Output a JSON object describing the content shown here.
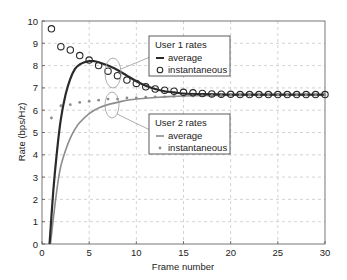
{
  "chart_data": {
    "type": "line",
    "title": "",
    "xlabel": "Frame number",
    "ylabel": "Rate (bps/Hz)",
    "xlim": [
      0,
      30
    ],
    "ylim": [
      0,
      10
    ],
    "xticks": [
      0,
      5,
      10,
      15,
      20,
      25,
      30
    ],
    "yticks": [
      0,
      1,
      2,
      3,
      4,
      5,
      6,
      7,
      8,
      9,
      10
    ],
    "grid": true,
    "series": [
      {
        "name": "User 1 rates - average",
        "style": "line",
        "color": "#2a2a2a",
        "x": [
          0.8,
          1.2,
          1.6,
          2.0,
          2.5,
          3.0,
          3.5,
          4.0,
          4.5,
          5.0,
          5.5,
          6.0,
          7.0,
          8.0,
          9.0,
          10.0,
          11.0,
          12.0,
          13.0,
          14.0,
          15.0,
          17.0,
          20.0,
          25.0,
          30.0
        ],
        "values": [
          0.0,
          2.4,
          4.2,
          5.6,
          6.7,
          7.4,
          7.85,
          8.05,
          8.15,
          8.2,
          8.2,
          8.15,
          8.0,
          7.8,
          7.55,
          7.3,
          7.1,
          6.95,
          6.85,
          6.8,
          6.75,
          6.72,
          6.7,
          6.7,
          6.7
        ]
      },
      {
        "name": "User 1 rates - instantaneous",
        "style": "circle-marker",
        "color": "#2a2a2a",
        "x": [
          1,
          2,
          3,
          4,
          5,
          6,
          7,
          8,
          9,
          10,
          11,
          12,
          13,
          14,
          15,
          16,
          17,
          18,
          19,
          20,
          21,
          22,
          23,
          24,
          25,
          26,
          27,
          28,
          29,
          30
        ],
        "values": [
          9.65,
          8.85,
          8.7,
          8.45,
          8.25,
          8.0,
          7.75,
          7.55,
          7.35,
          7.2,
          7.05,
          6.95,
          6.9,
          6.85,
          6.8,
          6.78,
          6.75,
          6.73,
          6.72,
          6.71,
          6.7,
          6.7,
          6.7,
          6.7,
          6.7,
          6.7,
          6.7,
          6.7,
          6.7,
          6.7
        ]
      },
      {
        "name": "User 2 rates - average",
        "style": "line",
        "color": "#8c8c8c",
        "x": [
          0.9,
          1.3,
          1.7,
          2.0,
          2.5,
          3.0,
          3.5,
          4.0,
          5.0,
          6.0,
          7.0,
          8.0,
          9.0,
          10.0,
          12.0,
          14.0,
          16.0,
          20.0,
          25.0,
          30.0
        ],
        "values": [
          0.0,
          1.5,
          2.8,
          3.5,
          4.2,
          4.75,
          5.15,
          5.45,
          5.85,
          6.1,
          6.25,
          6.35,
          6.45,
          6.5,
          6.57,
          6.62,
          6.65,
          6.67,
          6.68,
          6.68
        ]
      },
      {
        "name": "User 2 rates - instantaneous",
        "style": "dot-marker",
        "color": "#8c8c8c",
        "x": [
          1,
          2,
          3,
          4,
          5,
          6,
          7,
          8,
          9,
          10,
          11,
          12,
          13,
          14,
          15,
          16,
          17,
          18,
          19,
          20,
          21,
          22,
          23,
          24,
          25,
          26,
          27,
          28,
          29,
          30
        ],
        "values": [
          5.65,
          6.2,
          6.25,
          6.35,
          6.4,
          6.45,
          6.5,
          6.5,
          6.55,
          6.55,
          6.58,
          6.6,
          6.6,
          6.62,
          6.63,
          6.64,
          6.65,
          6.66,
          6.66,
          6.67,
          6.67,
          6.67,
          6.68,
          6.68,
          6.68,
          6.68,
          6.68,
          6.68,
          6.68,
          6.68
        ]
      }
    ],
    "legends": [
      {
        "title": "User 1 rates",
        "entries": [
          {
            "symbol": "line",
            "label": "average"
          },
          {
            "symbol": "circle",
            "label": "instantaneous"
          }
        ]
      },
      {
        "title": "User 2 rates",
        "entries": [
          {
            "symbol": "line",
            "label": "average"
          },
          {
            "symbol": "dot",
            "label": "instantaneous"
          }
        ]
      }
    ],
    "annotations": [
      {
        "type": "ellipse",
        "target": "User 1 rates",
        "at_frame": 7.5
      },
      {
        "type": "ellipse",
        "target": "User 2 rates",
        "at_frame": 7.5
      }
    ]
  },
  "colors": {
    "user1": "#2a2a2a",
    "user2": "#8c8c8c",
    "grid": "#c8c8c8",
    "axis": "#555555"
  }
}
